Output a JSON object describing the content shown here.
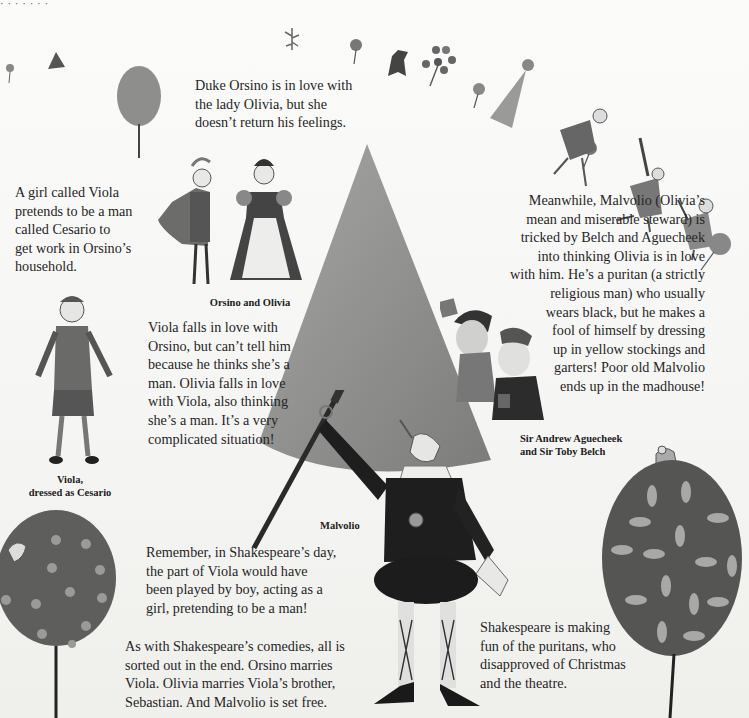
{
  "page": {
    "top_cutoff_text": "· · · · · · ·",
    "paragraphs": {
      "duke_orsino": "Duke Orsino is in love with\nthe lady Olivia, but she\ndoesn’t return his feelings.",
      "viola_intro": "A girl called Viola\npretends to be a man\ncalled Cesario to\nget work in Orsino’s\nhousehold.",
      "malvolio": "Meanwhile, Malvolio (Olivia’s\nmean and miserable steward) is\ntricked by Belch and Aguecheek\ninto thinking Olivia is in love\nwith him. He’s a puritan (a strictly\nreligious man) who usually\nwears black, but he makes a\nfool of himself by dressing\nup in yellow stockings and\ngarters! Poor old Malvolio\nends up in the madhouse!",
      "viola_love": "Viola falls in love with\nOrsino, but can’t tell him\nbecause he thinks she’s a\nman. Olivia falls in love\nwith Viola, also thinking\nshe’s a man. It’s a very\ncomplicated situation!",
      "remember": "Remember, in Shakespeare’s day,\nthe part of Viola would have\nbeen played by boy, acting as a\ngirl, pretending to be a man!",
      "comedies": "As with Shakespeare’s comedies, all is\nsorted out in the end. Orsino marries\nViola. Olivia marries Viola’s brother,\nSebastian. And Malvolio is set free.",
      "puritans": "Shakespeare is making\nfun of the puritans, who\ndisapproved of Christmas\nand the theatre."
    },
    "captions": {
      "orsino_olivia": "Orsino and Olivia",
      "viola": "Viola,\ndressed as Cesario",
      "belch_aguecheek": "Sir Andrew Aguecheek\nand Sir Toby Belch",
      "malvolio": "Malvolio"
    },
    "illustrations": [
      {
        "name": "orsino-and-olivia-illustration"
      },
      {
        "name": "viola-cesario-illustration"
      },
      {
        "name": "malvolio-illustration"
      },
      {
        "name": "belch-aguecheek-illustration"
      },
      {
        "name": "dotted-tree-illustration"
      },
      {
        "name": "leaf-tree-illustration"
      },
      {
        "name": "cone-tree-illustration"
      },
      {
        "name": "dancing-revelers-illustration"
      }
    ],
    "colors": {
      "background": "#f6f6f4",
      "text": "#262626",
      "cone": "#8a8a88",
      "tree_dark": "#555",
      "malvolio_black": "#1e1e1e"
    }
  }
}
